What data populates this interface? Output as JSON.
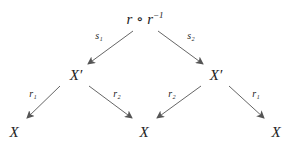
{
  "nodes": {
    "top": {
      "base": "r ∘ r",
      "sup": "−1"
    },
    "mid_left": "X′",
    "mid_right": "X′",
    "bottom_left": "X",
    "bottom_center": "X",
    "bottom_right": "X"
  },
  "edges": {
    "top_to_mid_left": "s₁",
    "top_to_mid_right": "s₂",
    "mid_left_to_bottom_left": "r₁",
    "mid_left_to_bottom_center": "r₂",
    "mid_right_to_bottom_center": "r₂",
    "mid_right_to_bottom_right": "r₁"
  },
  "colors": {
    "arrow": "#555555",
    "text": "#222222"
  }
}
